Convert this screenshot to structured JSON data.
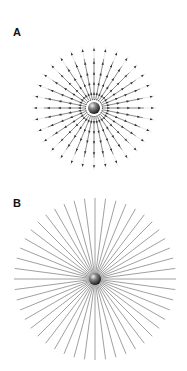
{
  "panels": [
    {
      "label": "A",
      "label_pos": [
        13,
        27
      ],
      "center": [
        94,
        108
      ],
      "rays": 32,
      "inner_radius": 9,
      "outer_radius": 62,
      "arrow_radii": [
        16,
        26,
        36,
        47,
        60
      ],
      "sphere_radius": 6,
      "ring_radius": 8.5,
      "line_color": "#7a7a7a",
      "arrow_color": "#333333"
    },
    {
      "label": "B",
      "label_pos": [
        13,
        198
      ],
      "center": [
        95,
        279
      ],
      "rays": 48,
      "inner_radius": 0,
      "outer_radius": 81,
      "sphere_radius": 6,
      "line_color": "#888888"
    }
  ]
}
